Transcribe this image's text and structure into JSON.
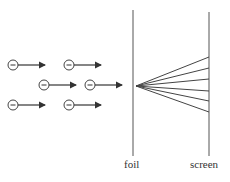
{
  "diagram": {
    "labels": {
      "foil": "foil",
      "screen": "screen"
    },
    "electron_symbol": "−",
    "electrons": [
      {
        "x": 13,
        "y": 65
      },
      {
        "x": 69,
        "y": 65
      },
      {
        "x": 44,
        "y": 85
      },
      {
        "x": 90,
        "y": 85
      },
      {
        "x": 13,
        "y": 105
      },
      {
        "x": 69,
        "y": 105
      }
    ],
    "foil_x": 133,
    "screen_x": 209,
    "fan_origin": {
      "x": 136,
      "y": 86
    },
    "fan_ends_y": [
      57,
      68,
      79,
      91,
      101,
      112
    ],
    "colors": {
      "stroke": "#444444",
      "text": "#333333"
    }
  }
}
